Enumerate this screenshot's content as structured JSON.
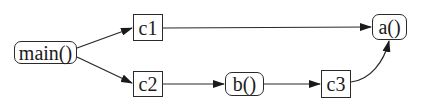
{
  "diagram": {
    "type": "call-graph",
    "nodes": [
      {
        "id": "main",
        "label": "main()",
        "shape": "rounded"
      },
      {
        "id": "c1",
        "label": "c1",
        "shape": "box"
      },
      {
        "id": "c2",
        "label": "c2",
        "shape": "box"
      },
      {
        "id": "b",
        "label": "b()",
        "shape": "rounded"
      },
      {
        "id": "c3",
        "label": "c3",
        "shape": "box"
      },
      {
        "id": "a",
        "label": "a()",
        "shape": "rounded"
      }
    ],
    "edges": [
      {
        "from": "main",
        "to": "c1"
      },
      {
        "from": "main",
        "to": "c2"
      },
      {
        "from": "c1",
        "to": "a"
      },
      {
        "from": "c2",
        "to": "b"
      },
      {
        "from": "b",
        "to": "c3"
      },
      {
        "from": "c3",
        "to": "a"
      }
    ],
    "colors": {
      "stroke": "#2a2a2a",
      "background": "#ffffff",
      "text": "#1a1a1a"
    }
  }
}
